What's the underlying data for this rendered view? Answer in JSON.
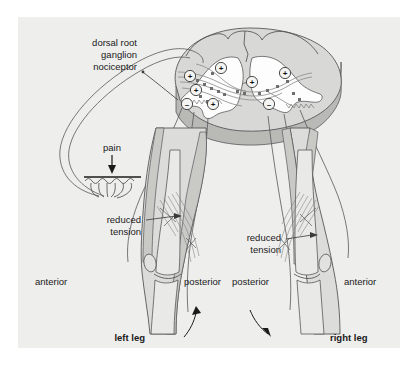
{
  "figure": {
    "panel_bg": "#eeeeec",
    "page_bg": "#ffffff",
    "ink": "#1a1a1a",
    "outline": "#58585a",
    "cord_fill": "#d8d8d6",
    "cord_gray_matter": "#ffffff",
    "cord_side": "#b9b9b6",
    "leg_fill": "#dcdcda",
    "muscle_fill": "#c9c9c6",
    "bone_fill": "#e9e9e7"
  },
  "labels": {
    "dorsal_root": {
      "line1": "dorsal root",
      "line2": "ganglion",
      "line3": "nociceptor",
      "x": 137,
      "y": 46
    },
    "pain": {
      "text": "pain",
      "x": 101,
      "y": 148
    },
    "reduced_tension_left": {
      "line1": "reduced",
      "line2": "tension",
      "x": 141,
      "y": 226
    },
    "reduced_tension_right": {
      "line1": "reduced",
      "line2": "tension",
      "x": 281,
      "y": 244
    },
    "anterior_left": {
      "text": "anterior",
      "x": 64,
      "y": 282
    },
    "posterior_left": {
      "text": "posterior",
      "x": 190,
      "y": 282
    },
    "posterior_right": {
      "text": "posterior",
      "x": 253,
      "y": 282
    },
    "anterior_right": {
      "text": "anterior",
      "x": 368,
      "y": 282
    },
    "left_leg": {
      "text": "left leg",
      "x": 145,
      "y": 341
    },
    "right_leg": {
      "text": "right leg",
      "x": 330,
      "y": 341
    }
  },
  "synapses": [
    {
      "id": "s1",
      "sign": "+",
      "x": 221,
      "y": 68,
      "side": "left"
    },
    {
      "id": "s2",
      "sign": "+",
      "x": 190,
      "y": 76,
      "side": "left"
    },
    {
      "id": "s3",
      "sign": "+",
      "x": 196,
      "y": 90,
      "side": "left"
    },
    {
      "id": "s4",
      "sign": "-",
      "x": 187,
      "y": 104,
      "side": "left"
    },
    {
      "id": "s5",
      "sign": "+",
      "x": 213,
      "y": 104,
      "side": "left"
    },
    {
      "id": "s6",
      "sign": "+",
      "x": 252,
      "y": 82,
      "side": "right"
    },
    {
      "id": "s7",
      "sign": "+",
      "x": 285,
      "y": 73,
      "side": "right"
    },
    {
      "id": "s8",
      "sign": "-",
      "x": 269,
      "y": 104,
      "side": "right"
    }
  ],
  "chart_data": {
    "type": "diagram",
    "elements": [
      "spinal cord cross-section (3D block)",
      "dorsal root ganglion nociceptor afferent",
      "pain stimulus at skin with free nerve endings",
      "left leg flexor withdrawal",
      "right leg crossed extensor",
      "excitatory synapses (+)",
      "inhibitory synapses (-)"
    ]
  }
}
